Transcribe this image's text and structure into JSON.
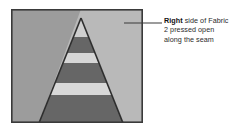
{
  "figure": {
    "name": "fabric-seam-diagram",
    "illustration": {
      "alt_label": "fabric panel with pressed-open triangular seam",
      "border_color": "#3a3a3a",
      "left_panel_color": "#9c9c9c",
      "right_panel_color": "#b9b9b9",
      "seam_line_color": "#2e2e2e",
      "stripe_dark_color": "#6b6b6b",
      "stripe_light_color": "#d0d0d0",
      "stripe_band_color": "#dcdcdc",
      "regions": [
        {
          "label": "left-fabric-panel",
          "shade": "medium-gray"
        },
        {
          "label": "right-fabric-panel",
          "shade": "light-gray"
        },
        {
          "label": "seam-allowance-triangle",
          "shade": "striped"
        }
      ],
      "stripes": [
        {
          "index": 1,
          "tone": "light"
        },
        {
          "index": 2,
          "tone": "dark"
        },
        {
          "index": 3,
          "tone": "light"
        },
        {
          "index": 4,
          "tone": "dark"
        },
        {
          "index": 5,
          "tone": "light"
        },
        {
          "index": 6,
          "tone": "dark"
        }
      ]
    },
    "callout": {
      "leader_line_color": "#3a3a3a",
      "line1_bold": "Right",
      "line1_rest": " side of Fabric",
      "line2": "2 pressed open",
      "line3": "along the seam"
    }
  }
}
